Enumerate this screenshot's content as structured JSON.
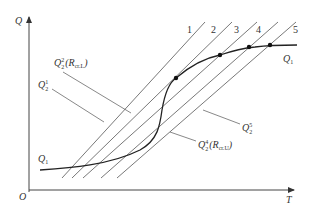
{
  "diagram": {
    "axes": {
      "y_label": "Q",
      "x_label": "T",
      "origin_label": "O"
    },
    "lines": [
      {
        "id": "1",
        "label": "1"
      },
      {
        "id": "2",
        "label": "2"
      },
      {
        "id": "3",
        "label": "3"
      },
      {
        "id": "4",
        "label": "4"
      },
      {
        "id": "5",
        "label": "5"
      }
    ],
    "curve": {
      "label_right": "Q",
      "label_right_sub": "1",
      "label_left": "Q",
      "label_left_sub": "1"
    },
    "annotations": {
      "q2_2": {
        "base": "Q",
        "sup": "2",
        "sub": "2",
        "paren": "(R",
        "paren_sub": "cr.L",
        "paren_close": ")"
      },
      "q2_1": {
        "base": "Q",
        "sup": "1",
        "sub": "2"
      },
      "q2_4": {
        "base": "Q",
        "sup": "4",
        "sub": "2",
        "paren": "(R",
        "paren_sub": "cr.U",
        "paren_close": ")"
      },
      "q2_5": {
        "base": "Q",
        "sup": "5",
        "sub": "2"
      }
    },
    "intersection_points": 4,
    "colors": {
      "axis": "#444444",
      "lines": "#555555",
      "curve": "#222222"
    }
  }
}
